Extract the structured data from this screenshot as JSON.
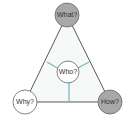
{
  "diagram": {
    "title": "",
    "colors": {
      "triangle_stroke": "#5a5a5a",
      "triangle_fill": "#f7f8f8",
      "connector": "#6fb8c8",
      "gray_node": "#a8a8a8",
      "white_node": "#ffffff",
      "node_stroke": "#666666"
    },
    "nodes": [
      {
        "id": "what",
        "label": "What?",
        "position": "top",
        "fill": "gray"
      },
      {
        "id": "why",
        "label": "Why?",
        "position": "bottom-left",
        "fill": "white"
      },
      {
        "id": "how",
        "label": "How?",
        "position": "bottom-right",
        "fill": "gray"
      },
      {
        "id": "who",
        "label": "Who?",
        "position": "center",
        "fill": "white"
      }
    ]
  }
}
